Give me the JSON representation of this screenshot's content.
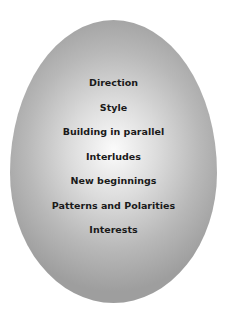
{
  "diagram": {
    "shape": "egg",
    "items": [
      {
        "label": "Direction"
      },
      {
        "label": "Style"
      },
      {
        "label": "Building in parallel"
      },
      {
        "label": "Interludes"
      },
      {
        "label": "New beginnings"
      },
      {
        "label": "Patterns and Polarities"
      },
      {
        "label": "Interests"
      }
    ]
  }
}
